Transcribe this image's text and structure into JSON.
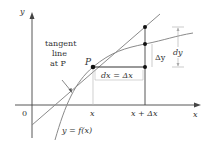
{
  "diagram": {
    "axes": {
      "x_label": "x",
      "y_label": "y",
      "origin_label": "0"
    },
    "ticks": {
      "x_tick": "x",
      "x_plus_dx_tick": "x + Δx"
    },
    "labels": {
      "point_p": "P",
      "tangent_line_1": "tangent",
      "tangent_line_2": "line",
      "tangent_line_3": "at P",
      "dx_label": "dx = Δx",
      "delta_y_label": "Δy",
      "dy_label": "dy",
      "curve_label": "y = f(x)"
    },
    "colors": {
      "axis": "#444444",
      "curve": "#8a8a8a",
      "tangent": "#8a8a8a",
      "points": "#111111",
      "brackets": "#9a9a9a",
      "text": "#333333"
    }
  }
}
